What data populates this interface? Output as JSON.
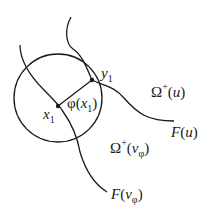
{
  "diagram": {
    "type": "geometric-figure",
    "stroke_color": "#1a1a1a",
    "background": "#ffffff",
    "circle": {
      "cx": 58,
      "cy": 98,
      "r": 44
    },
    "points": {
      "x1": {
        "x": 58,
        "y": 106,
        "label_main": "x",
        "label_sub": "1"
      },
      "y1": {
        "x": 92,
        "y": 80,
        "label_main": "y",
        "label_sub": "1"
      }
    },
    "segment_label": {
      "phi": "φ",
      "open": "(",
      "var": "x",
      "sub": "1",
      "close": ")"
    },
    "curves": {
      "F_u": {
        "name": "F",
        "open": "(",
        "arg": "u",
        "close": ")"
      },
      "F_v": {
        "name": "F",
        "open": "(",
        "arg": "v",
        "arg_sub": "φ",
        "close": ")"
      }
    },
    "regions": {
      "omega_u": {
        "symbol": "Ω",
        "sup": "+",
        "open": "(",
        "arg": "u",
        "close": ")"
      },
      "omega_v": {
        "symbol": "Ω",
        "sup": "+",
        "open": "(",
        "arg": "v",
        "arg_sub": "φ",
        "close": ")"
      }
    }
  }
}
